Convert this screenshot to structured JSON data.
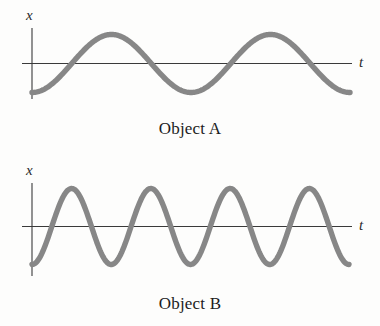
{
  "figure": {
    "background_color": "#fdfdfc",
    "curve_color": "#878787",
    "axis_color": "#3a3a3a",
    "text_color": "#1c1c1c"
  },
  "panels": [
    {
      "id": "object-a",
      "caption": "Object A",
      "y_axis_label": "x",
      "x_axis_label": "t"
    },
    {
      "id": "object-b",
      "caption": "Object B",
      "y_axis_label": "x",
      "x_axis_label": "t"
    }
  ],
  "chart_data": [
    {
      "type": "line",
      "title": "Object A",
      "xlabel": "t",
      "ylabel": "x",
      "grid": false,
      "legend": null,
      "annotations": [
        "Object A"
      ],
      "xlim": [
        0,
        2.0
      ],
      "ylim": [
        -1.15,
        1.15
      ],
      "axis_ticks": {
        "x": [],
        "y": []
      },
      "description": "Sinusoidal displacement starting at a minimum at t = 0; two full cycles shown; amplitude 1.0, period 1.0 (arbitrary units).",
      "series": [
        {
          "name": "x(t) = -A cos(2*pi*t/T)",
          "amplitude": 1.0,
          "period": 1.0,
          "phase_deg": 180,
          "cycles": 2.0,
          "x": [
            0.0,
            0.0625,
            0.125,
            0.1875,
            0.25,
            0.3125,
            0.375,
            0.4375,
            0.5,
            0.5625,
            0.625,
            0.6875,
            0.75,
            0.8125,
            0.875,
            0.9375,
            1.0,
            1.0625,
            1.125,
            1.1875,
            1.25,
            1.3125,
            1.375,
            1.4375,
            1.5,
            1.5625,
            1.625,
            1.6875,
            1.75,
            1.8125,
            1.875,
            1.9375,
            2.0
          ],
          "values": [
            -1.0,
            -0.924,
            -0.707,
            -0.383,
            0.0,
            0.383,
            0.707,
            0.924,
            1.0,
            0.924,
            0.707,
            0.383,
            0.0,
            -0.383,
            -0.707,
            -0.924,
            -1.0,
            -0.924,
            -0.707,
            -0.383,
            0.0,
            0.383,
            0.707,
            0.924,
            1.0,
            0.924,
            0.707,
            0.383,
            0.0,
            -0.383,
            -0.707,
            -0.924,
            -1.0
          ]
        }
      ]
    },
    {
      "type": "line",
      "title": "Object B",
      "xlabel": "t",
      "ylabel": "x",
      "grid": false,
      "legend": null,
      "annotations": [
        "Object B"
      ],
      "xlim": [
        0,
        2.0
      ],
      "ylim": [
        -1.15,
        1.15
      ],
      "axis_ticks": {
        "x": [],
        "y": []
      },
      "description": "Sinusoidal displacement starting at a minimum at t = 0; four full cycles shown over the same time span as Object A; amplitude 1.0, period 0.5 (arbitrary units).",
      "series": [
        {
          "name": "x(t) = -A cos(2*pi*t/T)",
          "amplitude": 1.0,
          "period": 0.5,
          "phase_deg": 180,
          "cycles": 4.0,
          "x": [
            0.0,
            0.03125,
            0.0625,
            0.09375,
            0.125,
            0.15625,
            0.1875,
            0.21875,
            0.25,
            0.28125,
            0.3125,
            0.34375,
            0.375,
            0.40625,
            0.4375,
            0.46875,
            0.5,
            0.53125,
            0.5625,
            0.59375,
            0.625,
            0.65625,
            0.6875,
            0.71875,
            0.75,
            0.78125,
            0.8125,
            0.84375,
            0.875,
            0.90625,
            0.9375,
            0.96875,
            1.0,
            1.03125,
            1.0625,
            1.09375,
            1.125,
            1.15625,
            1.1875,
            1.21875,
            1.25,
            1.28125,
            1.3125,
            1.34375,
            1.375,
            1.40625,
            1.4375,
            1.46875,
            1.5,
            1.53125,
            1.5625,
            1.59375,
            1.625,
            1.65625,
            1.6875,
            1.71875,
            1.75,
            1.78125,
            1.8125,
            1.84375,
            1.875,
            1.90625,
            1.9375,
            1.96875,
            2.0
          ],
          "values": [
            -1.0,
            -0.924,
            -0.707,
            -0.383,
            0.0,
            0.383,
            0.707,
            0.924,
            1.0,
            0.924,
            0.707,
            0.383,
            0.0,
            -0.383,
            -0.707,
            -0.924,
            -1.0,
            -0.924,
            -0.707,
            -0.383,
            0.0,
            0.383,
            0.707,
            0.924,
            1.0,
            0.924,
            0.707,
            0.383,
            0.0,
            -0.383,
            -0.707,
            -0.924,
            -1.0,
            -0.924,
            -0.707,
            -0.383,
            0.0,
            0.383,
            0.707,
            0.924,
            1.0,
            0.924,
            0.707,
            0.383,
            0.0,
            -0.383,
            -0.707,
            -0.924,
            -1.0,
            -0.924,
            -0.707,
            -0.383,
            0.0,
            0.383,
            0.707,
            0.924,
            1.0,
            0.924,
            0.707,
            0.383,
            0.0,
            -0.383,
            -0.707,
            -0.924,
            -1.0
          ]
        }
      ]
    }
  ]
}
